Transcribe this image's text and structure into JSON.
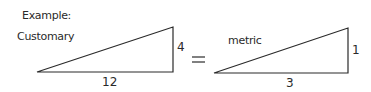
{
  "heading": "Example:",
  "left": {
    "label": "Customary",
    "height_label": "4",
    "base_label": "12"
  },
  "operator": "=",
  "right": {
    "label": "metric",
    "height_label": "1",
    "base_label": "3"
  },
  "colors": {
    "ink": "#2a2a2a",
    "background": "#ffffff"
  }
}
